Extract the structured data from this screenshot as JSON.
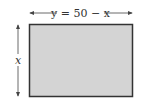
{
  "diagram": {
    "top_label": "y = 50 − x",
    "side_label": "x",
    "colors": {
      "fill": "#d4d4d4",
      "stroke": "#333333",
      "arrow": "#444444"
    }
  }
}
